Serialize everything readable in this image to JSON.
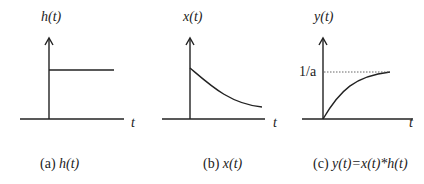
{
  "panels": [
    {
      "id": "a",
      "ylabel": "h(t)",
      "xlabel": "t",
      "caption_prefix": "(a) ",
      "caption_expr": "h(t)",
      "shape": "step"
    },
    {
      "id": "b",
      "ylabel": "x(t)",
      "xlabel": "t",
      "caption_prefix": "(b) ",
      "caption_expr": "x(t)",
      "shape": "decaying-exponential"
    },
    {
      "id": "c",
      "ylabel": "y(t)",
      "xlabel": "t",
      "level_label": "1/a",
      "caption_prefix": "(c) ",
      "caption_expr": "y(t)=x(t)*h(t)",
      "shape": "rising-exponential-to-asymptote"
    }
  ],
  "colors": {
    "ink": "#222222",
    "dotted": "#555555"
  }
}
